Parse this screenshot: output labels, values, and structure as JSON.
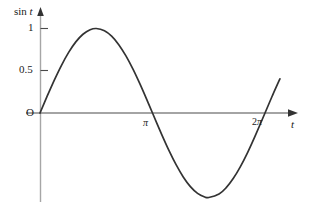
{
  "figure": {
    "background": "#ffffff",
    "width": 311,
    "height": 219
  },
  "axes": {
    "y_axis_label": "sin t",
    "y_axis_label_prefix": "sin ",
    "y_axis_label_var": "t",
    "x_axis_label": "t",
    "origin_label": "O",
    "y_ticks": [
      {
        "value": 1,
        "label": "1"
      },
      {
        "value": 0.5,
        "label": "0.5"
      }
    ],
    "x_ticks": [
      {
        "value": 3.14159,
        "label_pre": "",
        "label": "π"
      },
      {
        "value": 6.28318,
        "label_pre": "2",
        "label": "π"
      }
    ],
    "axis_color": "#9a9a9a",
    "x_axis_color": "#555555",
    "tick_color": "#555555"
  },
  "chart_data": {
    "type": "line",
    "title": "",
    "xlabel": "t",
    "ylabel": "sin t",
    "xlim": [
      0,
      7.0
    ],
    "ylim": [
      -1.15,
      1.25
    ],
    "grid": false,
    "legend": null,
    "curve_color": "#333333",
    "curve_width": 1.7,
    "series": [
      {
        "name": "sin t",
        "function": "sin(t)",
        "x": [
          0,
          0.2,
          0.4,
          0.6,
          0.8,
          1.0,
          1.2,
          1.4,
          1.5708,
          1.8,
          2.0,
          2.2,
          2.4,
          2.6,
          2.8,
          3.0,
          3.14159,
          3.4,
          3.6,
          3.8,
          4.0,
          4.2,
          4.4,
          4.6,
          4.7124,
          5.0,
          5.2,
          5.4,
          5.6,
          5.8,
          6.0,
          6.28318,
          6.5,
          6.7
        ],
        "y": [
          0,
          0.1987,
          0.3894,
          0.5646,
          0.7174,
          0.8415,
          0.932,
          0.9854,
          1.0,
          0.9738,
          0.9093,
          0.8085,
          0.6755,
          0.5155,
          0.335,
          0.1411,
          0,
          -0.2555,
          -0.4425,
          -0.6119,
          -0.7568,
          -0.8716,
          -0.9516,
          -0.9937,
          -1.0,
          -0.9589,
          -0.8835,
          -0.7728,
          -0.6313,
          -0.4646,
          -0.2794,
          0,
          0.2151,
          0.4048
        ]
      }
    ],
    "annotations": [
      {
        "text": "1",
        "x": 0,
        "y": 1,
        "position": "y-tick"
      },
      {
        "text": "0.5",
        "x": 0,
        "y": 0.5,
        "position": "y-tick"
      },
      {
        "text": "O",
        "x": 0,
        "y": 0,
        "position": "origin"
      },
      {
        "text": "π",
        "x": 3.14159,
        "y": 0,
        "position": "x-tick"
      },
      {
        "text": "2π",
        "x": 6.28318,
        "y": 0,
        "position": "x-tick"
      }
    ]
  }
}
